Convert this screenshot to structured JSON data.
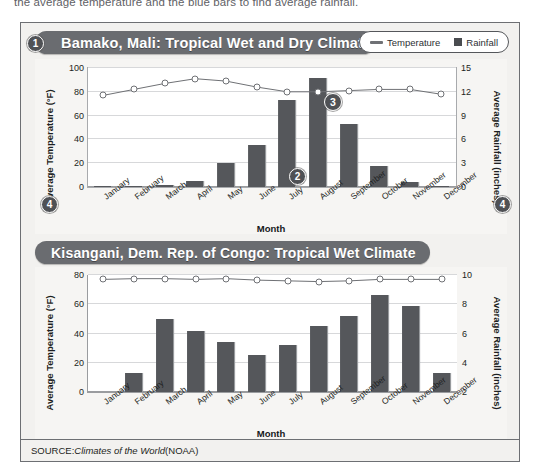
{
  "instruction": "the average temperature and the blue bars to find average rainfall.",
  "legend": {
    "temperature_label": "Temperature",
    "rainfall_label": "Rainfall",
    "line_icon": "line-icon",
    "square_icon": "square-icon"
  },
  "callouts": {
    "one": "1",
    "two": "2",
    "three": "3",
    "four_left": "4",
    "four_right": "4"
  },
  "source": {
    "prefix": "SOURCE: ",
    "italic_title": "Climates of the World",
    "suffix": " (NOAA)"
  },
  "colors": {
    "banner": "#6a6c70",
    "bar": "#55575b",
    "line": "#6f7175",
    "frame": "#6d6f73",
    "page_bg": "#f2f1ef"
  },
  "chart_data": [
    {
      "type": "bar",
      "title": "Bamako, Mali: Tropical Wet and Dry Climate",
      "xlabel": "Month",
      "ylabel": "Average Temperature (°F)",
      "y2label": "Average Rainfall (inches)",
      "categories": [
        "January",
        "February",
        "March",
        "April",
        "May",
        "June",
        "July",
        "August",
        "September",
        "October",
        "November",
        "December"
      ],
      "ylim": [
        0,
        100
      ],
      "yticks": [
        0,
        20,
        40,
        60,
        80,
        100
      ],
      "y2lim": [
        0,
        15
      ],
      "y2ticks": [
        0,
        3,
        6,
        9,
        12,
        15
      ],
      "grid": true,
      "legend_position": "top-right",
      "series": [
        {
          "name": "Rainfall",
          "type": "bar",
          "axis": "right",
          "unit": "inches",
          "values": [
            0.1,
            0.1,
            0.2,
            0.7,
            3.0,
            5.3,
            11.0,
            13.7,
            8.0,
            2.7,
            0.6,
            0.1
          ]
        },
        {
          "name": "Temperature",
          "type": "line",
          "axis": "left",
          "unit": "°F",
          "values": [
            77,
            82,
            87,
            91,
            89,
            84,
            80,
            80,
            81,
            82,
            82,
            78
          ]
        }
      ]
    },
    {
      "type": "bar",
      "title": "Kisangani, Dem. Rep. of Congo: Tropical Wet Climate",
      "xlabel": "Month",
      "ylabel": "Average Temperature (°F)",
      "y2label": "Average Rainfall (inches)",
      "categories": [
        "January",
        "February",
        "March",
        "April",
        "May",
        "June",
        "July",
        "August",
        "September",
        "October",
        "November",
        "December"
      ],
      "ylim": [
        0,
        80
      ],
      "yticks": [
        0,
        20,
        40,
        60,
        80
      ],
      "y2lim": [
        2,
        10
      ],
      "y2ticks": [
        2,
        4,
        6,
        8,
        10
      ],
      "grid": true,
      "series": [
        {
          "name": "Rainfall",
          "type": "bar",
          "axis": "right",
          "unit": "inches",
          "values": [
            2.0,
            3.3,
            7.0,
            6.2,
            5.4,
            4.5,
            5.2,
            6.5,
            7.2,
            8.6,
            7.9,
            3.3
          ]
        },
        {
          "name": "Temperature",
          "type": "line",
          "axis": "left",
          "unit": "°F",
          "values": [
            77,
            77.5,
            77.5,
            77,
            77.5,
            76.5,
            76,
            75.5,
            76,
            77,
            77,
            77
          ]
        }
      ]
    }
  ]
}
